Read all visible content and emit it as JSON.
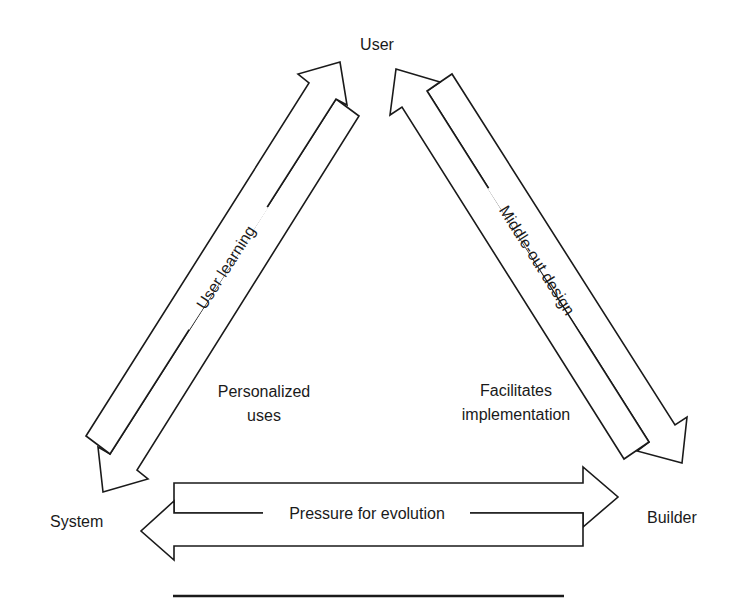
{
  "diagram": {
    "nodes": {
      "user": "User",
      "system": "System",
      "builder": "Builder"
    },
    "edges": {
      "user_system": {
        "label": "User learning",
        "side_note_line1": "Personalized",
        "side_note_line2": "uses",
        "directions": [
          "System → User",
          "User → System"
        ]
      },
      "user_builder": {
        "label": "Middle-out design",
        "side_note_line1": "Facilitates",
        "side_note_line2": "implementation",
        "directions": [
          "Builder → User",
          "User → Builder"
        ]
      },
      "system_builder": {
        "label": "Pressure for evolution",
        "directions": [
          "System → Builder",
          "Builder → System"
        ]
      }
    },
    "colors": {
      "stroke": "#1a1a1a",
      "background": "#ffffff"
    }
  }
}
